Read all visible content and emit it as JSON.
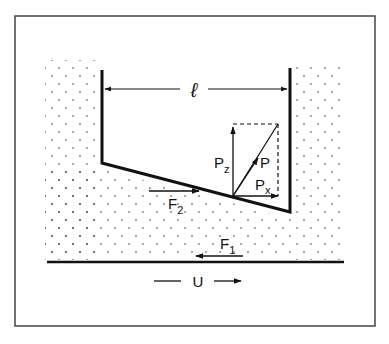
{
  "figure": {
    "labels": {
      "length": "ℓ",
      "P": "P",
      "Pz_main": "P",
      "Pz_sub": "z",
      "Px_main": "P",
      "Px_sub": "x",
      "F1_main": "F",
      "F1_sub": "1",
      "F2_main": "F",
      "F2_sub": "2",
      "U": "U"
    },
    "colors": {
      "ink": "#111111",
      "frame": "#444444",
      "background": "#ffffff"
    }
  }
}
